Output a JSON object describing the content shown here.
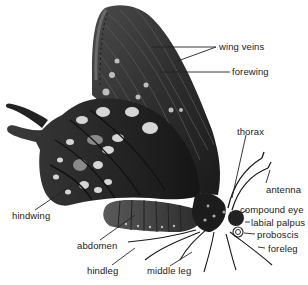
{
  "diagram": {
    "labels": {
      "wing_veins": "wing veins",
      "forewing": "forewing",
      "thorax": "thorax",
      "antenna": "antenna",
      "compound_eye": "compound eye",
      "labial_palpus": "labial palpus",
      "proboscis": "proboscis",
      "foreleg": "foreleg",
      "hindwing": "hindwing",
      "abdomen": "abdomen",
      "hindleg": "hindleg",
      "middle_leg": "middle leg"
    }
  }
}
